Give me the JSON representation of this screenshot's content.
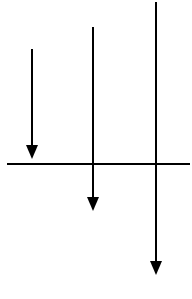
{
  "diagram": {
    "stroke_color": "#000000",
    "background": "#ffffff",
    "baseline": {
      "x1": 7,
      "y": 164,
      "x2": 190,
      "width": 2
    },
    "arrows": [
      {
        "id": "arrow-1",
        "x": 32,
        "y_start": 49,
        "y_tip": 159,
        "direction": "down",
        "head_width": 12,
        "head_height": 14
      },
      {
        "id": "arrow-2",
        "x": 93,
        "y_start": 27,
        "y_tip": 211,
        "direction": "down",
        "head_width": 12,
        "head_height": 14
      },
      {
        "id": "arrow-3",
        "x": 156,
        "y_start": 2,
        "y_tip": 275,
        "direction": "down",
        "head_width": 12,
        "head_height": 14
      }
    ]
  }
}
